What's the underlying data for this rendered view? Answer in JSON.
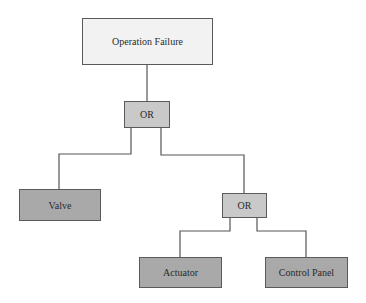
{
  "diagram": {
    "type": "fault-tree",
    "top_event": {
      "label": "Operation Failure"
    },
    "gate_1": {
      "label": "OR"
    },
    "gate_2": {
      "label": "OR"
    },
    "events": {
      "valve": {
        "label": "Valve"
      },
      "actuator": {
        "label": "Actuator"
      },
      "control_panel": {
        "label": "Control Panel"
      }
    },
    "colors": {
      "top_fill": "#f2f2f2",
      "gate_fill": "#c9c9c9",
      "leaf_fill": "#a9a9a9",
      "stroke": "#555555"
    }
  }
}
